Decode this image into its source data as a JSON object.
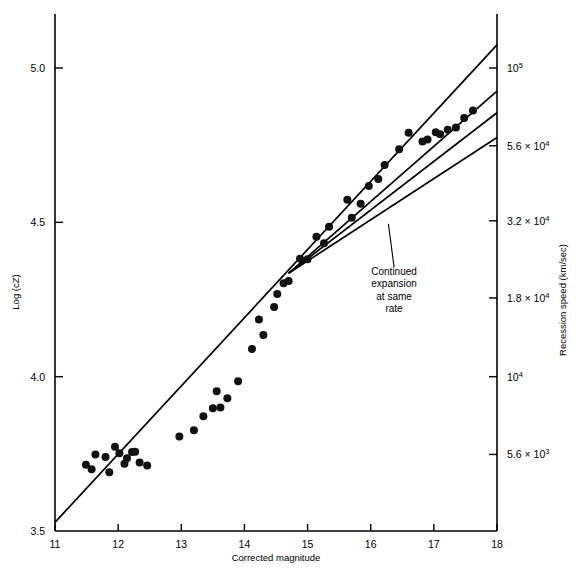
{
  "chart_data": {
    "type": "scatter",
    "title": "",
    "xlabel": "Corrected magnitude",
    "ylabel": "Log (cZ)",
    "y2label": "Recession speed (km/sec)",
    "xlim": [
      11,
      18
    ],
    "ylim": [
      3.5,
      5.15
    ],
    "grid": false,
    "legend_position": "none",
    "xticks": [
      11,
      12,
      13,
      14,
      15,
      16,
      17,
      18
    ],
    "xticklabels": [
      "11",
      "12",
      "13",
      "14",
      "15",
      "16",
      "17",
      "18"
    ],
    "yticks": [
      3.5,
      4.0,
      4.5,
      5.0
    ],
    "yticklabels": [
      "3.5",
      "4.0",
      "4.5",
      "5.0"
    ],
    "y2ticks": [
      3.748,
      4.0,
      4.255,
      4.505,
      4.748,
      5.0
    ],
    "y2ticklabels": [
      {
        "mantissa": "5.6 × 10",
        "exponent": "3"
      },
      {
        "mantissa": "10",
        "exponent": "4"
      },
      {
        "mantissa": "1.8 × 10",
        "exponent": "4"
      },
      {
        "mantissa": "3.2 × 10",
        "exponent": "4"
      },
      {
        "mantissa": "5.6 × 10",
        "exponent": "4"
      },
      {
        "mantissa": "10",
        "exponent": "5"
      }
    ],
    "points": [
      [
        11.49,
        3.715
      ],
      [
        11.58,
        3.7
      ],
      [
        11.64,
        3.748
      ],
      [
        11.8,
        3.74
      ],
      [
        11.86,
        3.69
      ],
      [
        11.95,
        3.773
      ],
      [
        12.02,
        3.752
      ],
      [
        12.1,
        3.718
      ],
      [
        12.14,
        3.736
      ],
      [
        12.22,
        3.756
      ],
      [
        12.27,
        3.757
      ],
      [
        12.34,
        3.722
      ],
      [
        12.46,
        3.712
      ],
      [
        12.97,
        3.806
      ],
      [
        13.2,
        3.826
      ],
      [
        13.35,
        3.872
      ],
      [
        13.5,
        3.898
      ],
      [
        13.56,
        3.953
      ],
      [
        13.62,
        3.9
      ],
      [
        13.73,
        3.93
      ],
      [
        13.9,
        3.985
      ],
      [
        14.12,
        4.09
      ],
      [
        14.23,
        4.185
      ],
      [
        14.3,
        4.135
      ],
      [
        14.47,
        4.226
      ],
      [
        14.52,
        4.268
      ],
      [
        14.62,
        4.303
      ],
      [
        14.7,
        4.31
      ],
      [
        14.88,
        4.382
      ],
      [
        15.0,
        4.38
      ],
      [
        15.14,
        4.453
      ],
      [
        15.26,
        4.432
      ],
      [
        15.34,
        4.486
      ],
      [
        15.63,
        4.573
      ],
      [
        15.7,
        4.515
      ],
      [
        15.84,
        4.56
      ],
      [
        15.97,
        4.618
      ],
      [
        16.12,
        4.64
      ],
      [
        16.22,
        4.686
      ],
      [
        16.45,
        4.737
      ],
      [
        16.6,
        4.79
      ],
      [
        16.82,
        4.762
      ],
      [
        16.9,
        4.768
      ],
      [
        17.03,
        4.792
      ],
      [
        17.1,
        4.785
      ],
      [
        17.22,
        4.8
      ],
      [
        17.35,
        4.807
      ],
      [
        17.48,
        4.838
      ],
      [
        17.62,
        4.862
      ]
    ],
    "lines": [
      {
        "name": "fit-line-upper",
        "x": [
          11.0,
          18.0
        ],
        "y": [
          3.528,
          5.075
        ]
      },
      {
        "name": "fit-line-second",
        "x": [
          14.7,
          18.0
        ],
        "y": [
          4.335,
          4.925
        ]
      },
      {
        "name": "fit-line-third",
        "x": [
          14.7,
          18.0
        ],
        "y": [
          4.335,
          4.855
        ]
      },
      {
        "name": "fit-line-lower",
        "x": [
          14.7,
          18.0
        ],
        "y": [
          4.335,
          4.775
        ]
      }
    ],
    "annotations": [
      {
        "name": "continued-expansion-note",
        "lines": [
          "Continued",
          "expansion",
          "at same",
          "rate"
        ],
        "text_x": 16.37,
        "text_y": 4.33,
        "leader_from": [
          16.28,
          4.495
        ],
        "leader_to": [
          16.37,
          4.355
        ]
      }
    ]
  },
  "axes": {
    "x_title": "Corrected magnitude",
    "y_title": "Log (cZ)",
    "y2_title": "Recession speed (km/sec)"
  },
  "colors": {
    "ink": "#000000",
    "background": "#ffffff",
    "axis": "#000000",
    "marker": "#111111"
  }
}
